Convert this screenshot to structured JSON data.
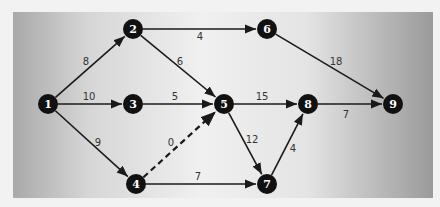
{
  "diagram": {
    "type": "network-graph",
    "colors": {
      "node_fill": "#111111",
      "edge": "#1a1a1a",
      "label": "#333333",
      "node_text": "#ffffff"
    },
    "nodes": [
      {
        "id": "1",
        "label": "1",
        "x": 48,
        "y": 104
      },
      {
        "id": "2",
        "label": "2",
        "x": 133,
        "y": 29
      },
      {
        "id": "3",
        "label": "3",
        "x": 133,
        "y": 104
      },
      {
        "id": "4",
        "label": "4",
        "x": 136,
        "y": 184
      },
      {
        "id": "5",
        "label": "5",
        "x": 224,
        "y": 104
      },
      {
        "id": "6",
        "label": "6",
        "x": 267,
        "y": 29
      },
      {
        "id": "7",
        "label": "7",
        "x": 267,
        "y": 184
      },
      {
        "id": "8",
        "label": "8",
        "x": 308,
        "y": 104
      },
      {
        "id": "9",
        "label": "9",
        "x": 393,
        "y": 104
      }
    ],
    "edges": [
      {
        "from": "1",
        "to": "2",
        "weight": "8",
        "dashed": false,
        "lx": 86,
        "ly": 65
      },
      {
        "from": "1",
        "to": "3",
        "weight": "10",
        "dashed": false,
        "lx": 89,
        "ly": 100
      },
      {
        "from": "1",
        "to": "4",
        "weight": "9",
        "dashed": false,
        "lx": 98,
        "ly": 146
      },
      {
        "from": "2",
        "to": "6",
        "weight": "4",
        "dashed": false,
        "lx": 200,
        "ly": 40
      },
      {
        "from": "2",
        "to": "5",
        "weight": "6",
        "dashed": false,
        "lx": 180,
        "ly": 65
      },
      {
        "from": "3",
        "to": "5",
        "weight": "5",
        "dashed": false,
        "lx": 175,
        "ly": 100
      },
      {
        "from": "4",
        "to": "5",
        "weight": "0",
        "dashed": true,
        "lx": 171,
        "ly": 146
      },
      {
        "from": "4",
        "to": "7",
        "weight": "7",
        "dashed": false,
        "lx": 198,
        "ly": 180
      },
      {
        "from": "5",
        "to": "8",
        "weight": "15",
        "dashed": false,
        "lx": 262,
        "ly": 100
      },
      {
        "from": "5",
        "to": "7",
        "weight": "12",
        "dashed": false,
        "lx": 252,
        "ly": 143
      },
      {
        "from": "6",
        "to": "9",
        "weight": "18",
        "dashed": false,
        "lx": 336,
        "ly": 65
      },
      {
        "from": "7",
        "to": "8",
        "weight": "4",
        "dashed": false,
        "lx": 293,
        "ly": 152
      },
      {
        "from": "8",
        "to": "9",
        "weight": "7",
        "dashed": false,
        "lx": 346,
        "ly": 118
      }
    ]
  }
}
